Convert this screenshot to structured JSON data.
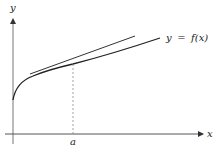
{
  "figure": {
    "type": "tangent-line-diagram",
    "axes": {
      "x_label": "x",
      "y_label": "y"
    },
    "curve": {
      "label_lhs": "y",
      "label_eq": "=",
      "label_rhs": "f(x)",
      "label_full": "y = f(x)"
    },
    "point": {
      "label": "a"
    },
    "colors": {
      "axis": "#666666",
      "curve": "#222222",
      "tangent": "#333333",
      "dashed": "#888888",
      "text": "#222222"
    }
  }
}
